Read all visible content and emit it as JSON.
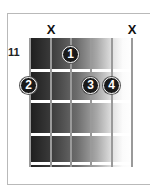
{
  "diagram": {
    "type": "guitar-chord-chart",
    "start_fret_label": "11",
    "strings": 6,
    "frets_shown": 4,
    "muted_marker": "X",
    "muted_strings": [
      2,
      6
    ],
    "fingers": [
      {
        "label": "1",
        "string": 3,
        "fret": 1
      },
      {
        "label": "2",
        "string": 1,
        "fret": 2
      },
      {
        "label": "3",
        "string": 4,
        "fret": 2
      },
      {
        "label": "4",
        "string": 5,
        "fret": 2
      }
    ],
    "colors": {
      "finger_fill": "#1a1a1a",
      "finger_text": "#ffffff",
      "fret_bar": "#ffffff",
      "string": "#9a9a9a",
      "board_dark": "#1e1e1e",
      "board_light": "#ffffff"
    }
  }
}
